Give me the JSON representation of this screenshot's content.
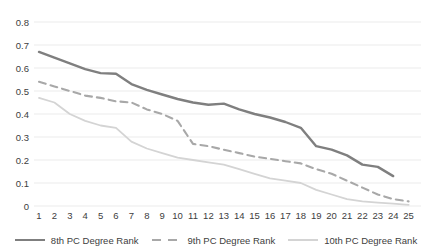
{
  "chart_data": {
    "type": "line",
    "title": "",
    "xlabel": "",
    "ylabel": "",
    "x_ticks": [
      1,
      2,
      3,
      4,
      5,
      6,
      7,
      8,
      9,
      10,
      11,
      12,
      13,
      14,
      15,
      16,
      17,
      18,
      19,
      20,
      21,
      22,
      23,
      24,
      25
    ],
    "y_ticks": [
      "0",
      "0.1",
      "0.2",
      "0.3",
      "0.4",
      "0.5",
      "0.6",
      "0.7",
      "0.8"
    ],
    "ylim": [
      0,
      0.8
    ],
    "grid": true,
    "legend_position": "bottom",
    "series": [
      {
        "name": "8th PC Degree Rank",
        "style": "solid",
        "color": "#7f7f7f",
        "width": 2.4,
        "values": [
          0.67,
          0.645,
          0.62,
          0.595,
          0.578,
          0.575,
          0.53,
          0.505,
          0.485,
          0.465,
          0.45,
          0.44,
          0.445,
          0.42,
          0.4,
          0.385,
          0.365,
          0.34,
          0.26,
          0.245,
          0.22,
          0.18,
          0.17,
          0.13
        ]
      },
      {
        "name": "9th PC Degree Rank",
        "style": "dashed",
        "color": "#a8a8a8",
        "width": 2.1,
        "values": [
          0.54,
          0.52,
          0.5,
          0.48,
          0.47,
          0.455,
          0.45,
          0.42,
          0.4,
          0.37,
          0.27,
          0.26,
          0.245,
          0.23,
          0.215,
          0.205,
          0.195,
          0.185,
          0.16,
          0.14,
          0.11,
          0.08,
          0.05,
          0.03,
          0.02
        ]
      },
      {
        "name": "10th PC Degree Rank",
        "style": "solid",
        "color": "#d4d4d4",
        "width": 1.8,
        "values": [
          0.47,
          0.45,
          0.4,
          0.37,
          0.35,
          0.34,
          0.28,
          0.25,
          0.23,
          0.21,
          0.2,
          0.19,
          0.18,
          0.16,
          0.14,
          0.12,
          0.11,
          0.1,
          0.07,
          0.05,
          0.03,
          0.02,
          0.015,
          0.01,
          0.005
        ]
      }
    ]
  },
  "colors": {
    "background": "#ffffff",
    "gridline": "#ebebeb",
    "tick_text": "#404040",
    "legend_text": "#404040"
  }
}
